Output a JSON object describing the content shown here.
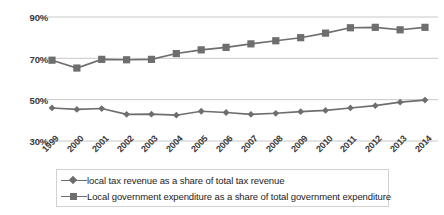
{
  "chart_data": {
    "type": "line",
    "title": "",
    "subtitle": "",
    "xlabel": "",
    "ylabel": "",
    "categories": [
      "1999",
      "2000",
      "2001",
      "2002",
      "2003",
      "2004",
      "2005",
      "2006",
      "2007",
      "2008",
      "2009",
      "2010",
      "2011",
      "2012",
      "2013",
      "2014"
    ],
    "ylim": [
      30,
      90
    ],
    "yticks": [
      30,
      50,
      70,
      90
    ],
    "ytick_labels": [
      "30%",
      "50%",
      "70%",
      "90%"
    ],
    "grid": true,
    "legend_position": "bottom",
    "series": [
      {
        "name": "local tax revenue as a share of total tax revenue",
        "marker": "diamond",
        "color": "#6e6e6e",
        "values": [
          46.0,
          45.3,
          45.7,
          42.9,
          43.0,
          42.5,
          44.4,
          43.8,
          42.9,
          43.4,
          44.2,
          44.8,
          46.0,
          47.1,
          48.8,
          49.8
        ]
      },
      {
        "name": "Local government expenditure as a share of total government expenditure",
        "marker": "square",
        "color": "#6e6e6e",
        "values": [
          69.1,
          65.3,
          69.5,
          69.3,
          69.5,
          72.3,
          74.1,
          75.3,
          77.0,
          78.5,
          80.0,
          82.2,
          84.8,
          85.0,
          83.8,
          85.0
        ]
      }
    ]
  },
  "axis": {
    "ytick_labels": [
      "90%",
      "70%",
      "50%",
      "30%"
    ],
    "xtick_labels": [
      "1999",
      "2000",
      "2001",
      "2002",
      "2003",
      "2004",
      "2005",
      "2006",
      "2007",
      "2008",
      "2009",
      "2010",
      "2011",
      "2012",
      "2013",
      "2014"
    ]
  },
  "legend": {
    "items": [
      {
        "label": "local tax revenue as a share of total tax revenue",
        "marker": "diamond-marker"
      },
      {
        "label": "Local government expenditure as a share of total government expenditure",
        "marker": "square-marker"
      }
    ]
  },
  "colors": {
    "series": "#6e6e6e",
    "grid": "#c8c8c8",
    "text": "#1c1c1c",
    "background": "#ffffff"
  }
}
